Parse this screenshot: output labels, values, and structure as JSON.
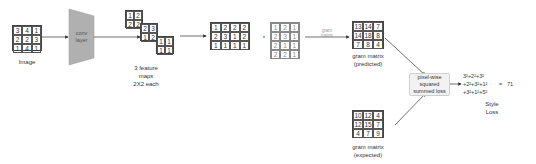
{
  "input_image": {
    "label": "Image",
    "matrix": [
      [
        "3",
        "4",
        "1"
      ],
      [
        "2",
        "2",
        "3"
      ],
      [
        "1",
        "4",
        "1"
      ]
    ]
  },
  "conv_layer": {
    "label_line1": "conv",
    "label_line2": "layer"
  },
  "feature_maps": {
    "label_line1": "3 feature",
    "label_line2": "maps",
    "label_line3": "2X2 each",
    "maps": [
      [
        [
          "1",
          "2"
        ],
        [
          "2",
          "2"
        ]
      ],
      [
        [
          "2",
          "3"
        ],
        [
          "1",
          "2"
        ]
      ],
      [
        [
          "1",
          "1"
        ],
        [
          "1",
          "1"
        ]
      ]
    ]
  },
  "flattened": {
    "matrix": [
      [
        "1",
        "2",
        "2",
        "2"
      ],
      [
        "2",
        "3",
        "1",
        "2"
      ],
      [
        "1",
        "1",
        "1",
        "1"
      ]
    ]
  },
  "multiply_symbol": "*",
  "transposed": {
    "matrix": [
      [
        "1",
        "2",
        "1"
      ],
      [
        "2",
        "3",
        "1"
      ],
      [
        "2",
        "1",
        "1"
      ],
      [
        "2",
        "2",
        "1"
      ]
    ]
  },
  "gram_arrow_label": {
    "line1": "gram",
    "line2": "matrix"
  },
  "gram_predicted": {
    "label_line1": "gram matrix",
    "label_line2": "(predicted)",
    "matrix": [
      [
        "13",
        "14",
        "7"
      ],
      [
        "14",
        "18",
        "8"
      ],
      [
        "7",
        "8",
        "4"
      ]
    ]
  },
  "gram_expected": {
    "label_line1": "gram matrix",
    "label_line2": "(expected)",
    "matrix": [
      [
        "10",
        "12",
        "4"
      ],
      [
        "12",
        "15",
        "7"
      ],
      [
        "4",
        "7",
        "9"
      ]
    ]
  },
  "loss_box": {
    "line1": "pixel-wise",
    "line2": "squared",
    "line3": "summed loss"
  },
  "formula": {
    "line1": "3²+2²+3²",
    "line2": "+2²+3²+1²",
    "line3": "+3²+1²+5²",
    "equals": "=",
    "result": "71"
  },
  "style_loss": {
    "line1": "Style",
    "line2": "Loss"
  },
  "colors": {
    "conv_fill": "#b0b0b0",
    "line": "#333333",
    "light_text": "#888888",
    "loss_box_fill": "#f2f2f2"
  }
}
